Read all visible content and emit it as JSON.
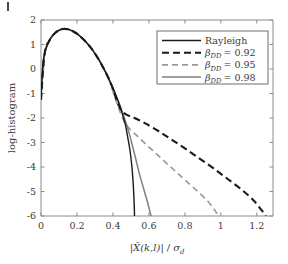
{
  "chart_data": {
    "type": "line",
    "title": "",
    "xlabel": "|X̂(k,l)| / σ_d",
    "ylabel": "log-histogram",
    "xlim": [
      0,
      1.29
    ],
    "ylim": [
      -6,
      2
    ],
    "xticks": [
      0,
      0.2,
      0.4,
      0.6,
      0.8,
      1,
      1.2
    ],
    "xtick_labels": [
      "0",
      "0.2",
      "0.4",
      "0.6",
      "0.8",
      "1",
      "1.2"
    ],
    "yticks": [
      2,
      1,
      0,
      -1,
      -2,
      -3,
      -4,
      -5,
      -6
    ],
    "ytick_labels": [
      "2",
      "1",
      "0",
      "-1",
      "-2",
      "-3",
      "-4",
      "-5",
      "-6"
    ],
    "grid": false,
    "legend_position": "top-right",
    "series": [
      {
        "name": "Rayleigh",
        "color": "#1a1a1a",
        "style": "solid",
        "width": 1.4,
        "points": [
          [
            0.0,
            -1.25
          ],
          [
            0.01,
            0.15
          ],
          [
            0.02,
            0.62
          ],
          [
            0.03,
            0.88
          ],
          [
            0.045,
            1.14
          ],
          [
            0.06,
            1.32
          ],
          [
            0.08,
            1.48
          ],
          [
            0.1,
            1.58
          ],
          [
            0.12,
            1.63
          ],
          [
            0.14,
            1.63
          ],
          [
            0.16,
            1.6
          ],
          [
            0.18,
            1.53
          ],
          [
            0.2,
            1.44
          ],
          [
            0.22,
            1.32
          ],
          [
            0.24,
            1.18
          ],
          [
            0.26,
            1.02
          ],
          [
            0.28,
            0.84
          ],
          [
            0.3,
            0.63
          ],
          [
            0.32,
            0.4
          ],
          [
            0.34,
            0.14
          ],
          [
            0.36,
            -0.14
          ],
          [
            0.38,
            -0.45
          ],
          [
            0.4,
            -0.78
          ],
          [
            0.42,
            -1.14
          ],
          [
            0.44,
            -1.53
          ],
          [
            0.455,
            -1.9
          ],
          [
            0.47,
            -2.3
          ],
          [
            0.48,
            -2.7
          ],
          [
            0.49,
            -3.1
          ],
          [
            0.498,
            -3.5
          ],
          [
            0.505,
            -3.95
          ],
          [
            0.51,
            -4.4
          ],
          [
            0.514,
            -4.85
          ],
          [
            0.517,
            -5.3
          ],
          [
            0.519,
            -5.7
          ],
          [
            0.52,
            -6.0
          ]
        ]
      },
      {
        "name": "β_DD = 0.92",
        "label_sub": "DD",
        "label_value": "0.92",
        "color": "#1a1a1a",
        "style": "dashed",
        "dasharray": "7,4",
        "width": 2.1,
        "points": [
          [
            0.0,
            -1.25
          ],
          [
            0.02,
            0.62
          ],
          [
            0.045,
            1.14
          ],
          [
            0.08,
            1.48
          ],
          [
            0.12,
            1.63
          ],
          [
            0.16,
            1.6
          ],
          [
            0.2,
            1.44
          ],
          [
            0.24,
            1.18
          ],
          [
            0.28,
            0.84
          ],
          [
            0.32,
            0.4
          ],
          [
            0.36,
            -0.14
          ],
          [
            0.39,
            -0.62
          ],
          [
            0.41,
            -1.05
          ],
          [
            0.43,
            -1.45
          ],
          [
            0.45,
            -1.72
          ],
          [
            0.48,
            -1.88
          ],
          [
            0.52,
            -2.0
          ],
          [
            0.58,
            -2.22
          ],
          [
            0.65,
            -2.52
          ],
          [
            0.72,
            -2.85
          ],
          [
            0.8,
            -3.24
          ],
          [
            0.88,
            -3.65
          ],
          [
            0.96,
            -4.06
          ],
          [
            1.04,
            -4.5
          ],
          [
            1.12,
            -4.95
          ],
          [
            1.18,
            -5.35
          ],
          [
            1.225,
            -5.75
          ],
          [
            1.25,
            -6.0
          ]
        ]
      },
      {
        "name": "β_DD = 0.95",
        "label_sub": "DD",
        "label_value": "0.95",
        "color": "#9a9a9a",
        "style": "dashed",
        "dasharray": "6,4",
        "width": 1.7,
        "points": [
          [
            0.0,
            -1.25
          ],
          [
            0.02,
            0.62
          ],
          [
            0.045,
            1.14
          ],
          [
            0.08,
            1.48
          ],
          [
            0.12,
            1.63
          ],
          [
            0.16,
            1.6
          ],
          [
            0.2,
            1.44
          ],
          [
            0.24,
            1.18
          ],
          [
            0.28,
            0.84
          ],
          [
            0.32,
            0.4
          ],
          [
            0.36,
            -0.14
          ],
          [
            0.385,
            -0.58
          ],
          [
            0.405,
            -1.02
          ],
          [
            0.425,
            -1.45
          ],
          [
            0.445,
            -1.85
          ],
          [
            0.465,
            -2.18
          ],
          [
            0.49,
            -2.42
          ],
          [
            0.53,
            -2.7
          ],
          [
            0.58,
            -3.05
          ],
          [
            0.64,
            -3.45
          ],
          [
            0.7,
            -3.86
          ],
          [
            0.76,
            -4.26
          ],
          [
            0.82,
            -4.66
          ],
          [
            0.88,
            -5.06
          ],
          [
            0.93,
            -5.42
          ],
          [
            0.965,
            -5.75
          ],
          [
            0.985,
            -6.0
          ]
        ]
      },
      {
        "name": "β_DD = 0.98",
        "label_sub": "DD",
        "label_value": "0.98",
        "color": "#808080",
        "style": "solid",
        "width": 1.5,
        "points": [
          [
            0.0,
            -1.25
          ],
          [
            0.01,
            0.15
          ],
          [
            0.02,
            0.62
          ],
          [
            0.03,
            0.88
          ],
          [
            0.045,
            1.14
          ],
          [
            0.06,
            1.32
          ],
          [
            0.08,
            1.48
          ],
          [
            0.1,
            1.58
          ],
          [
            0.12,
            1.63
          ],
          [
            0.14,
            1.63
          ],
          [
            0.16,
            1.6
          ],
          [
            0.18,
            1.53
          ],
          [
            0.2,
            1.44
          ],
          [
            0.22,
            1.32
          ],
          [
            0.24,
            1.18
          ],
          [
            0.26,
            1.02
          ],
          [
            0.28,
            0.84
          ],
          [
            0.3,
            0.63
          ],
          [
            0.32,
            0.4
          ],
          [
            0.34,
            0.14
          ],
          [
            0.36,
            -0.14
          ],
          [
            0.38,
            -0.45
          ],
          [
            0.4,
            -0.78
          ],
          [
            0.42,
            -1.14
          ],
          [
            0.44,
            -1.52
          ],
          [
            0.46,
            -1.92
          ],
          [
            0.478,
            -2.32
          ],
          [
            0.494,
            -2.72
          ],
          [
            0.508,
            -3.12
          ],
          [
            0.522,
            -3.52
          ],
          [
            0.535,
            -3.92
          ],
          [
            0.548,
            -4.3
          ],
          [
            0.562,
            -4.66
          ],
          [
            0.576,
            -5.02
          ],
          [
            0.59,
            -5.38
          ],
          [
            0.602,
            -5.72
          ],
          [
            0.612,
            -6.0
          ]
        ]
      }
    ]
  },
  "legend": {
    "entries": [
      {
        "label": "Rayleigh",
        "symbol": "β",
        "sub": "",
        "value": "",
        "plain": true
      },
      {
        "label": "β_DD = 0.92",
        "symbol": "β",
        "sub": "DD",
        "value": "0.92",
        "plain": false
      },
      {
        "label": "β_DD = 0.95",
        "symbol": "β",
        "sub": "DD",
        "value": "0.95",
        "plain": false
      },
      {
        "label": "β_DD = 0.98",
        "symbol": "β",
        "sub": "DD",
        "value": "0.98",
        "plain": false
      }
    ]
  },
  "axes": {
    "x_label_parts": {
      "abs_open": "|",
      "x_hat": "X̂",
      "args": "(k,l)",
      "abs_close": "|",
      "slash": "/",
      "sigma": "σ",
      "sigma_sub": "d"
    },
    "y_label": "log-histogram"
  },
  "colors": {
    "black": "#1a1a1a",
    "gray_dark": "#808080",
    "gray_light": "#9a9a9a",
    "axis": "#8c8c8c",
    "text": "#3b3b3b",
    "background": "#ffffff"
  }
}
